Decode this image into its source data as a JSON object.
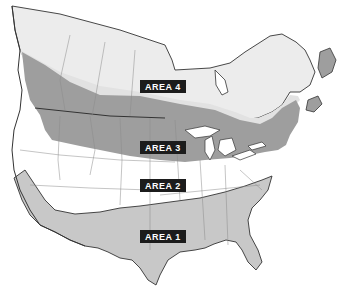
{
  "map": {
    "title": "",
    "region": "North America (USA and southern Canada)",
    "colors": {
      "background": "#ffffff",
      "area1": "#c8c8c8",
      "area2": "#ffffff",
      "area3": "#9e9e9e",
      "area4": "#e6e6e6",
      "canada_north": "#ececec",
      "maritimes": "#9e9e9e",
      "border": "#333333",
      "state_lines": "#8a8a8a",
      "label_bg": "#1c1c1c",
      "label_text": "#ffffff"
    },
    "labels": [
      {
        "id": "area4",
        "text": "AREA 4",
        "x": 147,
        "y": 79
      },
      {
        "id": "area3",
        "text": "AREA 3",
        "x": 147,
        "y": 142
      },
      {
        "id": "area2",
        "text": "AREA 2",
        "x": 147,
        "y": 180
      },
      {
        "id": "area1",
        "text": "AREA 1",
        "x": 147,
        "y": 231
      }
    ]
  }
}
